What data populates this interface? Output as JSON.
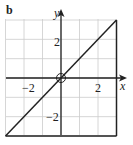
{
  "panel_label": "b",
  "chart_data": {
    "type": "line",
    "title": "",
    "xlabel": "x",
    "ylabel": "y",
    "xlim": [
      -3,
      3
    ],
    "ylim": [
      -3,
      3
    ],
    "grid": true,
    "x_ticks": [
      -2,
      2
    ],
    "y_ticks": [
      -2,
      2
    ],
    "x_tick_labels": [
      "−2",
      "2"
    ],
    "y_tick_labels": [
      "−2",
      "2"
    ],
    "series": [
      {
        "name": "y = x",
        "x": [
          -3,
          3
        ],
        "y": [
          -3,
          3
        ]
      },
      {
        "name": "vertical boundary x = 3",
        "x": [
          3,
          3
        ],
        "y": [
          -3,
          3
        ]
      },
      {
        "name": "horizontal boundary y = -3",
        "x": [
          -3,
          3
        ],
        "y": [
          -3,
          -3
        ]
      }
    ],
    "annotations": [
      {
        "type": "open-circle",
        "x": 0,
        "y": 0
      }
    ]
  },
  "colors": {
    "ink": "#222222",
    "grid": "#cccccc",
    "background": "#ffffff"
  }
}
